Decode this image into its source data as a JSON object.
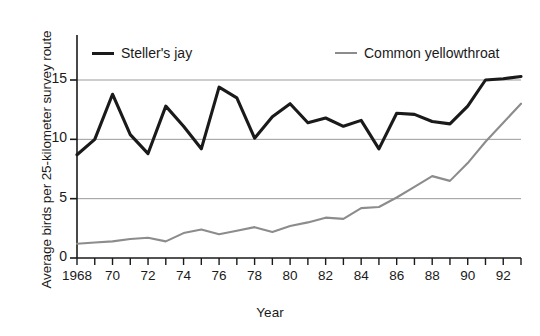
{
  "chart_data": {
    "type": "line",
    "title": "",
    "xlabel": "Year",
    "ylabel": "Average birds per 25-kilometer survey route",
    "xlim": [
      1968,
      1993
    ],
    "ylim": [
      0,
      16
    ],
    "yticks": [
      0,
      5,
      10,
      15
    ],
    "ytick_labels": [
      "0",
      "5",
      "10",
      "15"
    ],
    "xticks": [
      1968,
      1969,
      1970,
      1971,
      1972,
      1973,
      1974,
      1975,
      1976,
      1977,
      1978,
      1979,
      1980,
      1981,
      1982,
      1983,
      1984,
      1985,
      1986,
      1987,
      1988,
      1989,
      1990,
      1991,
      1992,
      1993
    ],
    "xtick_labels_shown": [
      {
        "year": 1968,
        "label": "1968"
      },
      {
        "year": 1970,
        "label": "70"
      },
      {
        "year": 1972,
        "label": "72"
      },
      {
        "year": 1974,
        "label": "74"
      },
      {
        "year": 1976,
        "label": "76"
      },
      {
        "year": 1978,
        "label": "78"
      },
      {
        "year": 1980,
        "label": "80"
      },
      {
        "year": 1982,
        "label": "82"
      },
      {
        "year": 1984,
        "label": "84"
      },
      {
        "year": 1986,
        "label": "86"
      },
      {
        "year": 1988,
        "label": "88"
      },
      {
        "year": 1990,
        "label": "90"
      },
      {
        "year": 1992,
        "label": "92"
      }
    ],
    "grid": "horizontal",
    "legend_position": "top",
    "x": [
      1968,
      1969,
      1970,
      1971,
      1972,
      1973,
      1974,
      1975,
      1976,
      1977,
      1978,
      1979,
      1980,
      1981,
      1982,
      1983,
      1984,
      1985,
      1986,
      1987,
      1988,
      1989,
      1990,
      1991,
      1992,
      1993
    ],
    "series": [
      {
        "name": "Steller's jay",
        "color": "#1a1a1a",
        "values": [
          8.7,
          10.0,
          13.8,
          10.4,
          8.8,
          12.8,
          11.1,
          9.2,
          14.4,
          13.5,
          10.1,
          11.9,
          13.0,
          11.4,
          11.8,
          11.1,
          11.6,
          9.2,
          12.2,
          12.1,
          11.5,
          11.3,
          12.8,
          15.0,
          15.1,
          15.3
        ]
      },
      {
        "name": "Common yellowthroat",
        "color": "#8c8c8c",
        "values": [
          1.2,
          1.3,
          1.4,
          1.6,
          1.7,
          1.4,
          2.1,
          2.4,
          2.0,
          2.3,
          2.6,
          2.2,
          2.7,
          3.0,
          3.4,
          3.3,
          4.2,
          4.3,
          5.1,
          6.0,
          6.9,
          6.5,
          8.0,
          9.8,
          11.4,
          13.0
        ]
      }
    ]
  },
  "legend": {
    "items": [
      {
        "label": "Steller's jay",
        "color": "#1a1a1a",
        "width": "3.2px"
      },
      {
        "label": "Common yellowthroat",
        "color": "#8c8c8c",
        "width": "2.2px"
      }
    ]
  },
  "axes": {
    "x_title": "Year",
    "y_title": "Average birds per 25-kilometer survey route"
  }
}
